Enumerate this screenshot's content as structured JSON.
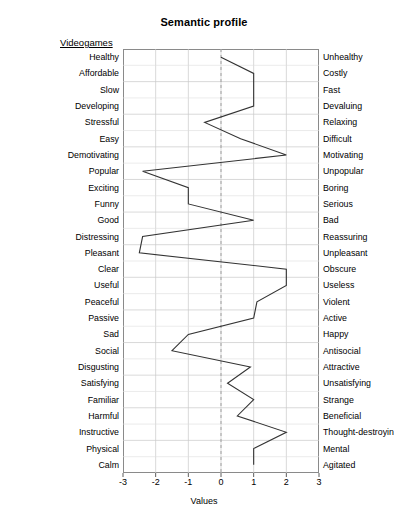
{
  "chart_data": {
    "type": "line",
    "title": "Semantic profile",
    "xlabel": "Values",
    "ylabel": "",
    "series_label": "Videogames",
    "orientation": "horizontal",
    "xlim": [
      -3,
      3
    ],
    "xticks": [
      -3,
      -2,
      -1,
      0,
      1,
      2,
      3
    ],
    "xticklabels": [
      "-3",
      "-2",
      "-1",
      "0",
      "1",
      "2",
      "3"
    ],
    "grid": true,
    "zero_reference_line": 0,
    "legend_position": "none",
    "left_labels": [
      "Healthy",
      "Affordable",
      "Slow",
      "Developing",
      "Stressful",
      "Easy",
      "Demotivating",
      "Popular",
      "Exciting",
      "Funny",
      "Good",
      "Distressing",
      "Pleasant",
      "Clear",
      "Useful",
      "Peaceful",
      "Passive",
      "Sad",
      "Social",
      "Disgusting",
      "Satisfying",
      "Familiar",
      "Harmful",
      "Instructive",
      "Physical",
      "Calm"
    ],
    "right_labels": [
      "Unhealthy",
      "Costly",
      "Fast",
      "Devaluing",
      "Relaxing",
      "Difficult",
      "Motivating",
      "Unpopular",
      "Boring",
      "Serious",
      "Bad",
      "Reassuring",
      "Unpleasant",
      "Obscure",
      "Useless",
      "Violent",
      "Active",
      "Happy",
      "Antisocial",
      "Attractive",
      "Unsatisfying",
      "Strange",
      "Beneficial",
      "Thought-destroyin",
      "Mental",
      "Agitated"
    ],
    "categories": [
      "Healthy",
      "Affordable",
      "Slow",
      "Developing",
      "Stressful",
      "Easy",
      "Demotivating",
      "Popular",
      "Exciting",
      "Funny",
      "Good",
      "Distressing",
      "Pleasant",
      "Clear",
      "Useful",
      "Peaceful",
      "Passive",
      "Sad",
      "Social",
      "Disgusting",
      "Satisfying",
      "Familiar",
      "Harmful",
      "Instructive",
      "Physical",
      "Calm"
    ],
    "values": [
      0.0,
      1.0,
      1.0,
      1.0,
      -0.5,
      0.6,
      2.0,
      -2.4,
      -1.0,
      -1.0,
      1.0,
      -2.4,
      -2.5,
      2.0,
      2.0,
      1.1,
      1.0,
      -1.0,
      -1.5,
      0.9,
      0.2,
      1.0,
      0.5,
      2.0,
      1.0,
      1.0
    ],
    "line_color": "#333333",
    "grid_color": "#c8c8c8",
    "zero_line_color": "#999999"
  }
}
